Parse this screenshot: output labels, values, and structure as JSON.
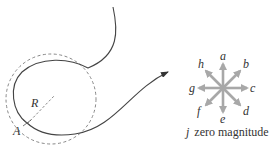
{
  "diagram": {
    "path_labels": {
      "radius": "R",
      "point": "A"
    },
    "compass": {
      "directions": [
        {
          "key": "a",
          "label": "a",
          "angle_deg": -90
        },
        {
          "key": "b",
          "label": "b",
          "angle_deg": -45
        },
        {
          "key": "c",
          "label": "c",
          "angle_deg": 0
        },
        {
          "key": "d",
          "label": "d",
          "angle_deg": 45
        },
        {
          "key": "e",
          "label": "e",
          "angle_deg": 90
        },
        {
          "key": "f",
          "label": "f",
          "angle_deg": 135
        },
        {
          "key": "g",
          "label": "g",
          "angle_deg": 180
        },
        {
          "key": "h",
          "label": "h",
          "angle_deg": -135
        }
      ],
      "zero_label": "j",
      "zero_text": "zero magnitude"
    },
    "colors": {
      "curve": "#444444",
      "dashed_circle": "#888888",
      "compass_arrows": "#a8a8a8",
      "text": "#333333"
    }
  }
}
